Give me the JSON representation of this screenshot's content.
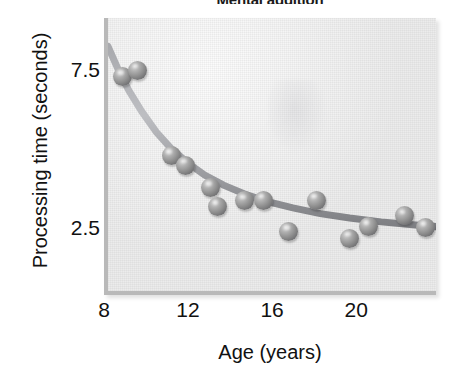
{
  "chart_data": {
    "type": "scatter",
    "title": "Mental addition",
    "xlabel": "Age (years)",
    "ylabel": "Processing time (seconds)",
    "xlim": [
      8,
      23.8
    ],
    "ylim": [
      0.45,
      9.2
    ],
    "xticks": [
      "8",
      "12",
      "16",
      "20"
    ],
    "xtick_values": [
      8,
      12,
      16,
      20
    ],
    "yticks": [
      "7.5",
      "2.5"
    ],
    "ytick_values": [
      7.5,
      2.5
    ],
    "grid": false,
    "legend": null,
    "x": [
      8.7,
      9.4,
      11.0,
      11.7,
      12.9,
      13.2,
      14.5,
      15.4,
      16.6,
      17.9,
      19.5,
      20.4,
      22.1,
      23.1
    ],
    "y": [
      7.35,
      7.55,
      4.85,
      4.55,
      3.85,
      3.25,
      3.42,
      3.45,
      2.45,
      3.45,
      2.25,
      2.62,
      2.95,
      2.58
    ],
    "points": [
      {
        "x": 8.7,
        "y": 7.35
      },
      {
        "x": 9.4,
        "y": 7.55
      },
      {
        "x": 11.0,
        "y": 4.85
      },
      {
        "x": 11.7,
        "y": 4.55
      },
      {
        "x": 12.9,
        "y": 3.85
      },
      {
        "x": 13.2,
        "y": 3.25
      },
      {
        "x": 14.5,
        "y": 3.42
      },
      {
        "x": 15.4,
        "y": 3.45
      },
      {
        "x": 16.6,
        "y": 2.45
      },
      {
        "x": 17.9,
        "y": 3.45
      },
      {
        "x": 19.5,
        "y": 2.25
      },
      {
        "x": 20.4,
        "y": 2.62
      },
      {
        "x": 22.1,
        "y": 2.95
      },
      {
        "x": 23.1,
        "y": 2.58
      }
    ],
    "fit_curve": {
      "description": "decaying power/exponential trend line",
      "x": [
        8.0,
        8.5,
        9.0,
        9.6,
        10.3,
        11.0,
        11.8,
        12.6,
        13.5,
        14.5,
        15.6,
        16.8,
        18.1,
        19.5,
        21.0,
        22.5,
        23.8
      ],
      "y": [
        8.3,
        7.55,
        6.9,
        6.25,
        5.6,
        5.08,
        4.62,
        4.24,
        3.92,
        3.64,
        3.4,
        3.2,
        3.02,
        2.88,
        2.76,
        2.67,
        2.6
      ]
    },
    "colors": {
      "plot_background": "#ececec",
      "frame": "#b9b9b9",
      "curve": "#8f9094",
      "point": "#8d8d8d",
      "text": "#111111"
    }
  }
}
